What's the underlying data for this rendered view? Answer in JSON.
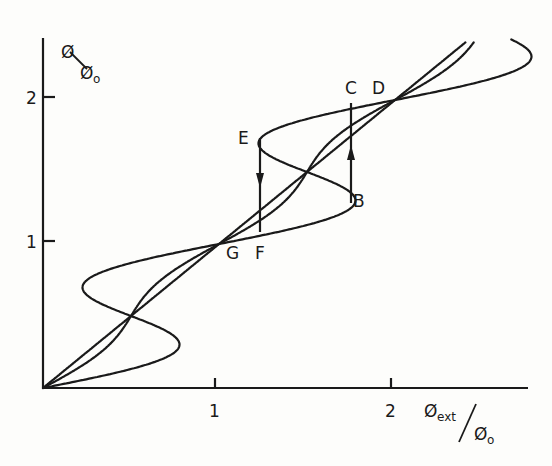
{
  "figure": {
    "y_axis_label": {
      "main": "Ø",
      "denom": "Ø",
      "denom_sub": "o"
    },
    "x_axis_label": {
      "main": "Ø",
      "main_sub": "ext",
      "denom": "Ø",
      "denom_sub": "o"
    },
    "x_ticks": [
      "1",
      "2"
    ],
    "y_ticks": [
      "1",
      "2"
    ],
    "point_labels": {
      "B": "B",
      "C": "C",
      "D": "D",
      "E": "E",
      "F": "F",
      "G": "G"
    },
    "line_color": "#1a1a1a",
    "background": "#fdfdfb"
  },
  "chart_data": {
    "type": "line",
    "title": "",
    "xlabel": "Øext/Øo",
    "ylabel": "Ø/Øo",
    "xlim": [
      0,
      2.75
    ],
    "ylim": [
      0,
      2.4
    ],
    "grid": false,
    "series": [
      {
        "name": "linear (Ø = Øext)",
        "relation": "x = y"
      },
      {
        "name": "weak screening",
        "relation": "x = y + 0.08·sin(2πy)"
      },
      {
        "name": "hysteretic (multivalued)",
        "relation": "x = y + 0.5·sin(2πy)"
      }
    ],
    "annotations": [
      {
        "label": "G",
        "x": 1.0,
        "y": 1.0
      },
      {
        "label": "F",
        "x": 1.25,
        "y": 0.96
      },
      {
        "label": "E",
        "x": 1.25,
        "y": 1.75
      },
      {
        "label": "B",
        "x": 1.75,
        "y": 1.25
      },
      {
        "label": "C",
        "x": 1.75,
        "y": 1.94
      },
      {
        "label": "D",
        "x": 2.0,
        "y": 2.0
      }
    ],
    "transitions": [
      {
        "from": "B",
        "to": "C",
        "direction": "up",
        "x": 1.75
      },
      {
        "from": "E",
        "to": "F",
        "direction": "down",
        "x": 1.25
      }
    ]
  }
}
